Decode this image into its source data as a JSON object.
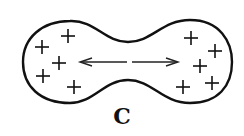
{
  "figure": {
    "label": "C",
    "stroke_color": "#111111",
    "charge_symbol": "+",
    "left_lobe_charges": [
      {
        "x": 42,
        "y": 47
      },
      {
        "x": 68,
        "y": 36
      },
      {
        "x": 59,
        "y": 63
      },
      {
        "x": 43,
        "y": 76
      },
      {
        "x": 74,
        "y": 87
      }
    ],
    "right_lobe_charges": [
      {
        "x": 191,
        "y": 38
      },
      {
        "x": 215,
        "y": 51
      },
      {
        "x": 200,
        "y": 66
      },
      {
        "x": 183,
        "y": 87
      },
      {
        "x": 212,
        "y": 83
      }
    ],
    "arrows": [
      {
        "direction": "left",
        "x1": 127,
        "x2": 80,
        "y": 62
      },
      {
        "direction": "right",
        "x1": 132,
        "x2": 178,
        "y": 62
      }
    ]
  }
}
